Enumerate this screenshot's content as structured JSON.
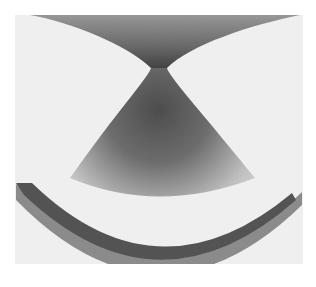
{
  "figure": {
    "colors": {
      "page_background": "#ffffff",
      "panel_background": "#efefef",
      "beam_dark": "#4a4a4a",
      "beam_mid": "#7a7a7a",
      "beam_light": "#d8d8d8",
      "arc_inner": "#5a5a5a",
      "arc_outer": "#8c8c8c"
    },
    "panel": {
      "x": 15,
      "y": 15,
      "width": 288,
      "height": 249
    },
    "focus": {
      "x": 158,
      "y": 68,
      "waist_width": 14
    }
  }
}
